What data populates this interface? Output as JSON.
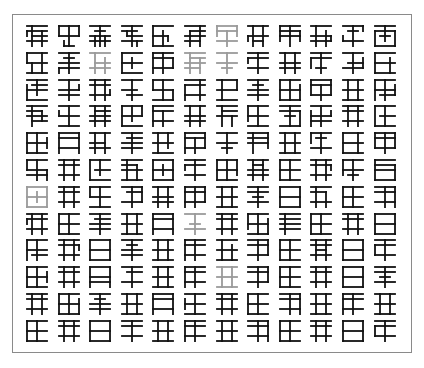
{
  "panel": {
    "description": "12x12 grid of procedurally generated glyph-like characters",
    "rows": 12,
    "cols": 12,
    "colors": {
      "ink": "#111111",
      "faded": "#9a9a9a",
      "border": "#8a8a8a",
      "background": "#ffffff"
    }
  },
  "layout": {
    "x0": 27,
    "y0": 26,
    "dx": 31.6,
    "dy": 26.8,
    "size": 20
  },
  "faded_cells": [
    [
      0,
      6
    ],
    [
      1,
      2
    ],
    [
      1,
      5
    ],
    [
      1,
      6
    ],
    [
      6,
      0
    ],
    [
      7,
      5
    ],
    [
      9,
      6
    ]
  ],
  "glyphs": [
    [
      "h0:0-4 h1:0-4 h2:1-4 h3:0-4 v1:0-4 v3:1-4 v0:1-2",
      "h0:0-4 h2:0-4 h4:1-3 v0:0-2 v4:0-2 v2:0-4 v1:3-4",
      "h0:0-4 h1:1-3 h2:0-4 h3:0-4 v2:0-4 v1:2-4 v3:2-4",
      "h0:0-4 h1:0-3 h2:1-4 h3:0-4 v2:0-4 v1:1-2 v3:3-4",
      "h0:0-4 h2:0-3 h4:0-4 v0:0-4 v2:1-4 v3:2-3",
      "h0:0-4 h1:1-4 h2:0-4 h3:0-3 v1:1-4 v3:0-4",
      "h0:0-4 h1:0-4 h3:0-4 v0:0-2 v4:0-2 v2:1-4",
      "h0:0-4 h2:0-4 h3:1-3 v1:0-4 v3:0-4 v0:2-3",
      "h0:0-4 h1:0-4 h2:0-4 v0:0-3 v2:0-4 v4:1-3",
      "h0:0-4 h2:0-4 h3:0-4 v1:0-4 v3:1-4 v4:2-3",
      "h0:0-4 h1:1-3 h3:0-4 v2:0-4 v0:2-3 v4:0-1",
      "h0:0-4 h1:0-4 h2:1-3 h4:0-4 v0:1-4 v2:0-3 v4:1-4"
    ],
    [
      "h0:0-4 h2:0-4 h4:0-4 v0:0-2 v3:0-4 v1:2-4",
      "h0:0-4 h1:1-3 h2:0-4 h3:0-4 v2:0-4 v0:3-4",
      "h0:0-4 h2:1-4 h3:0-4 v1:0-4 v3:1-4",
      "h0:0-4 h2:0-4 h4:0-4 v0:0-4 v2:1-3",
      "h0:0-4 h1:0-4 h3:0-4 v0:0-4 v2:0-4 v4:1-3",
      "h0:0-4 h1:1-4 h2:0-4 h3:0-3 v1:0-4 v3:1-4",
      "h0:0-4 h2:0-4 v2:0-4 h3:1-3",
      "h0:0-4 h1:0-4 h3:0-4 v2:0-4 v0:1-2",
      "h0:0-4 h2:0-4 h3:0-4 v1:0-4 v3:0-4",
      "h0:0-4 h1:0-4 h3:1-3 v2:0-4 v0:1-3",
      "h0:0-4 h2:1-4 h3:0-4 v2:0-4 v4:1-3",
      "h0:0-4 h2:0-4 h4:0-4 v0:0-4 v3:1-4"
    ],
    [
      "h0:0-4 h1:1-4 h2:0-4 h4:0-4 v0:1-4 v2:0-3",
      "h0:0-4 h2:0-4 h3:0-4 v2:0-4 v4:1-2",
      "h0:0-4 h1:0-4 h3:0-4 v1:0-4 v3:0-4 v4:2-3",
      "h0:0-4 h2:0-3 h3:1-4 v2:0-4",
      "h0:0-4 h2:0-4 h4:0-4 v0:0-2 v4:2-4 v2:0-4",
      "h0:0-4 h1:0-4 h3:0-4 v0:1-4 v3:0-4",
      "h0:0-4 h2:0-4 h4:0-4 v1:0-4 v4:0-2",
      "h0:0-4 h1:1-3 h2:0-4 h3:0-4 v2:0-4",
      "h0:0-4 h2:0-4 h4:0-4 v0:0-4 v2:0-4 v4:1-4",
      "h0:0-4 h1:0-4 h3:0-4 v0:0-3 v4:0-3 v2:1-4",
      "h0:0-4 h2:0-4 h4:0-4 v1:0-4 v3:0-4",
      "h0:0-4 h2:0-4 h3:1-4 v0:0-4 v2:0-4 v4:1-3"
    ],
    [
      "h0:0-4 h1:0-3 h2:0-4 h3:1-4 v1:0-4 v3:1-3",
      "h0:0-4 h2:0-4 h4:0-4 v2:0-4 v0:1-2",
      "h0:0-4 h1:1-4 h2:0-4 h3:0-4 v1:0-4 v3:0-4",
      "h0:0-4 h2:0-4 h4:0-4 v0:0-4 v2:0-3 v4:0-2",
      "h0:0-4 h1:0-4 h3:0-4 v0:0-4 v2:1-4",
      "h0:0-4 h2:0-4 h3:0-4 v1:0-4 v3:0-4",
      "h0:0-4 h1:1-4 h2:0-4 v1:0-4 v3:2-4",
      "h0:0-4 h2:0-4 h4:0-4 v0:0-3 v2:0-4",
      "h0:0-4 h1:0-4 h2:1-3 h4:0-4 v2:0-4 v4:1-4",
      "h0:0-4 h2:0-4 h3:0-4 v0:1-4 v2:0-4 v4:1-2",
      "h0:0-4 h1:0-4 h3:0-4 v1:0-4 v3:0-4",
      "h0:0-4 h2:1-4 h4:0-4 v0:0-4 v2:0-4"
    ],
    [
      "h0:0-4 h2:0-4 h4:0-4 v0:0-4 v2:0-4 v4:1-3",
      "h0:0-4 h1:0-4 h3:0-4 v0:0-4 v4:0-4",
      "h0:0-4 h2:0-3 h3:0-4 v1:0-4 v3:0-4",
      "h0:0-4 h1:1-4 h2:0-4 h3:0-4 v2:0-4",
      "h0:0-4 h2:0-4 h4:0-4 v1:0-4 v3:0-3",
      "h0:0-4 h1:0-4 h3:0-4 v0:0-4 v2:1-4 v4:0-3",
      "h0:0-4 h2:0-4 h3:1-3 v2:0-4",
      "h0:0-4 h1:0-4 h2:0-4 v1:0-4 v4:0-3",
      "h0:0-4 h2:0-4 h4:0-4 v1:0-4 v3:0-4",
      "h0:0-4 h1:1-3 h3:0-4 v2:0-4 v0:0-2",
      "h0:0-4 h2:0-4 h4:0-4 v0:0-4 v3:0-4",
      "h0:0-4 h1:0-4 h3:0-4 v0:0-3 v2:0-4 v4:0-3"
    ],
    [
      "h0:0-4 h2:0-4 h3:0-4 v0:0-2 v2:0-4 v4:2-4",
      "h0:0-4 h1:0-4 h3:0-4 v1:0-4 v3:0-4",
      "h0:0-4 h2:1-4 h4:0-4 v0:0-4 v2:0-3",
      "h0:0-4 h1:0-3 h2:0-4 h4:0-4 v1:0-4 v3:1-4",
      "h0:0-4 h2:0-4 h4:0-4 v0:0-4 v4:0-4 v2:1-3",
      "h0:0-4 h1:0-4 h3:0-4 v2:0-4 v0:1-2",
      "h0:0-4 h2:0-4 h4:0-4 v0:0-4 v2:0-4 v4:0-3",
      "h0:0-4 h1:1-3 h2:0-4 h3:0-4 v1:0-4 v3:0-4",
      "h0:0-4 h2:0-4 h4:0-4 v0:0-4 v2:0-4",
      "h0:0-4 h1:0-4 h3:0-4 v1:0-4 v3:0-4 v4:1-2",
      "h0:0-4 h2:0-4 h3:1-3 v2:0-4 v0:0-3",
      "h0:0-4 h1:0-4 h2:0-4 h4:0-4 v0:0-4 v4:1-4"
    ],
    [
      "h0:0-4 h2:0-4 h4:0-4 v0:0-4 v4:0-4 v2:1-3",
      "h0:0-4 h1:0-4 h3:0-4 v1:0-4 v3:0-4",
      "h0:0-4 h2:0-4 h4:0-4 v2:0-4 v0:0-2",
      "h0:0-4 h1:1-4 h3:0-4 v2:0-4 v4:0-3",
      "h0:0-4 h2:0-4 h3:0-4 v1:0-4 v3:0-4",
      "h0:0-4 h1:0-4 h3:0-4 v0:0-4 v2:0-4 v4:0-3",
      "h0:0-4 h2:0-4 h4:0-4 v1:0-4 v3:0-4",
      "h0:0-4 h1:0-4 h2:1-3 h3:0-4 v2:0-4",
      "h0:0-4 h2:0-4 h4:0-4 v0:0-4 v4:0-4",
      "h0:0-4 h1:0-3 h3:0-4 v1:0-4 v3:1-4",
      "h0:0-4 h2:0-4 h4:0-4 v0:0-4 v2:0-4",
      "h0:0-4 h1:0-4 h3:0-4 v2:0-4 v4:0-4"
    ],
    [
      "h0:0-4 h1:0-4 h3:0-4 v1:0-4 v3:0-4 v0:1-2",
      "h0:0-4 h2:0-4 h4:0-4 v0:0-4 v2:0-4",
      "h0:0-4 h1:1-4 h2:0-4 h3:0-4 v2:0-4",
      "h0:0-4 h2:0-4 h4:0-4 v1:0-4 v3:0-4",
      "h0:0-4 h1:0-4 h3:0-4 v0:0-4 v4:0-4",
      "h0:0-4 h2:1-3 h3:0-4 v2:0-4",
      "h0:0-4 h1:0-4 h3:0-4 v1:0-4 v3:0-4",
      "h0:0-4 h2:0-4 h4:0-4 v0:0-3 v2:0-4 v4:1-4",
      "h0:0-4 h1:0-4 h2:0-4 h3:0-4 v1:0-4",
      "h0:0-4 h2:0-4 h4:0-4 v0:0-4 v2:0-4",
      "h0:0-4 h1:0-4 h3:0-4 v1:0-4 v3:0-4",
      "h0:0-4 h2:0-4 h4:0-4 v0:0-4 v4:0-4"
    ],
    [
      "h0:0-4 h2:0-4 h3:1-4 v0:0-4 v2:0-4",
      "h0:0-4 h1:0-4 h3:0-4 v1:0-4 v3:0-4 v4:1-2",
      "h0:0-4 h2:0-4 h4:0-4 v0:0-4 v4:0-4",
      "h0:0-4 h1:1-3 h2:0-4 h3:0-4 v2:0-4",
      "h0:0-4 h2:0-4 h4:0-4 v1:0-4 v3:0-4",
      "h0:0-4 h1:0-4 h3:0-4 v0:0-4 v2:0-4",
      "h0:0-4 h2:0-4 h4:0-4 v1:0-4 v3:1-4",
      "h0:0-4 h1:0-4 h3:0-4 v2:0-4 v4:0-3",
      "h0:0-4 h2:0-4 h4:0-4 v0:0-4 v2:0-4",
      "h0:0-4 h1:0-4 h2:1-3 h3:0-4 v1:0-4 v3:0-4",
      "h0:0-4 h2:0-4 h4:0-4 v0:0-4 v4:0-4",
      "h0:0-4 h1:0-4 h3:0-4 v2:0-4 v0:1-3"
    ],
    [
      "h0:0-4 h2:0-4 h4:0-4 v0:0-4 v2:0-4 v4:1-3",
      "h0:0-4 h1:0-4 h3:0-4 v1:0-4 v3:0-4",
      "h0:0-4 h2:0-4 h3:0-4 v0:0-4 v4:0-4",
      "h0:0-4 h1:1-4 h3:0-4 v2:0-4",
      "h0:0-4 h2:0-4 h4:0-4 v1:0-4 v3:0-4",
      "h0:0-4 h1:0-4 h3:0-4 v0:0-4 v2:0-4",
      "h0:0-4 h2:0-4 h4:0-4 v1:0-4 v3:0-4",
      "h0:0-4 h1:0-4 h3:0-4 v2:0-4 v4:0-3",
      "h0:0-4 h2:0-4 h4:0-4 v0:0-4 v2:0-4",
      "h0:0-4 h1:0-4 h3:0-4 v1:0-4 v3:0-4",
      "h0:0-4 h2:0-4 h4:0-4 v0:0-4 v4:0-4",
      "h0:0-4 h1:0-4 h2:1-3 h3:0-4 v2:0-4"
    ],
    [
      "h0:0-4 h1:0-4 h3:0-4 v1:0-4 v3:0-4",
      "h0:0-4 h2:0-4 h4:0-4 v0:0-4 v2:0-4 v4:1-4",
      "h0:0-4 h1:1-3 h2:0-4 h3:0-4 v2:0-4",
      "h0:0-4 h2:0-4 h4:0-4 v1:0-4 v3:0-4",
      "h0:0-4 h1:0-4 h3:0-4 v0:0-4 v4:0-4",
      "h0:0-4 h2:0-4 h4:0-4 v2:0-4 v0:1-3",
      "h0:0-4 h1:0-4 h3:0-4 v1:0-4 v3:0-4",
      "h0:0-4 h2:0-4 h4:0-4 v0:0-4 v2:0-4",
      "h0:0-4 h1:0-4 h3:0-4 v2:0-4 v4:0-4",
      "h0:0-4 h2:0-4 h4:0-4 v1:0-4 v3:0-4",
      "h0:0-4 h1:0-4 h3:0-4 v0:0-4 v2:0-4",
      "h0:0-4 h2:0-4 h4:0-4 v1:0-4 v3:0-4"
    ],
    [
      "h0:0-4 h2:0-4 h4:0-4 v0:0-4 v2:0-4",
      "h0:0-4 h1:0-4 h3:0-4 v1:0-4 v3:0-4",
      "h0:0-4 h2:0-4 h4:0-4 v0:0-4 v4:0-4",
      "h0:0-4 h1:0-4 h3:0-4 v2:0-4",
      "h0:0-4 h2:0-4 h4:0-4 v1:0-4 v3:0-4",
      "h0:0-4 h1:0-4 h3:0-4 v0:0-4 v2:0-4",
      "h0:0-4 h2:0-4 h4:0-4 v1:0-4 v3:0-4",
      "h0:0-4 h1:0-4 h3:0-4 v2:0-4 v4:0-4",
      "h0:0-4 h2:0-4 h4:0-4 v0:0-4 v2:0-4",
      "h0:0-4 h1:0-4 h3:0-4 v1:0-4 v3:0-4",
      "h0:0-4 h2:0-4 h4:0-4 v0:0-4 v4:0-4",
      "h0:0-4 h1:0-4 h3:0-4 v2:0-4 v0:1-3"
    ]
  ]
}
